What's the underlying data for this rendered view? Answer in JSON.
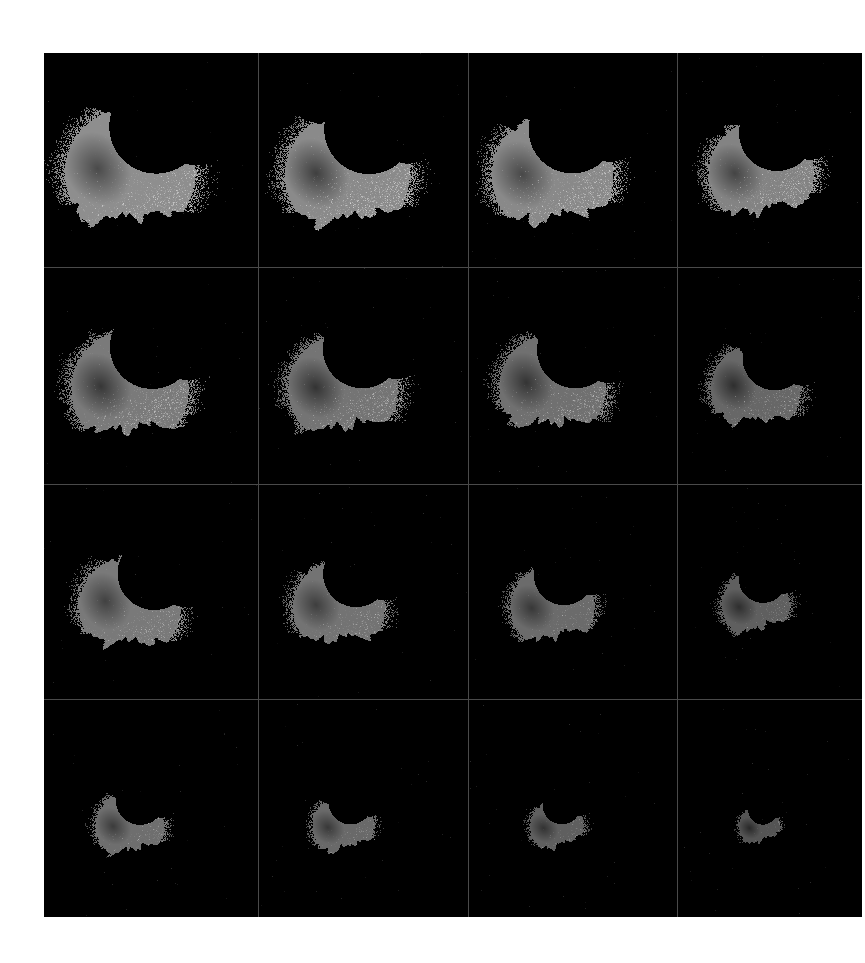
{
  "figure": {
    "name": "grayscale-particle-montage",
    "background_color": "#ffffff",
    "panel_background": "#000000",
    "grid_line_color": "#4a4a4a",
    "rows": 4,
    "columns": 4,
    "panel_count": 16,
    "left_margin_px": 44,
    "top_margin_px": 53,
    "grid_width_px": 818,
    "grid_height_px": 864
  },
  "palette": {
    "black": "#000000",
    "dark_core": "#3c3c3c",
    "mid_core": "#5a5a5a",
    "body_gray": "#8e8e8e",
    "light_gray": "#b8b8b8",
    "speckle_white": "#f2f2f2",
    "white": "#ffffff"
  },
  "chart_data": {
    "type": "heatmap",
    "title": "",
    "xlabel": "",
    "ylabel": "",
    "grid": true,
    "legend": "none",
    "panels": [
      {
        "index": 1,
        "row": 1,
        "col": 1,
        "label": "",
        "scale": 1.0,
        "brightness": 1.0,
        "cx": 0.4,
        "cy": 0.56,
        "rotation": -32,
        "core_gray": "#4a4a4a",
        "body_gray": "#8e8e8e",
        "speckle_density": 0.55,
        "area_fraction": 0.21
      },
      {
        "index": 2,
        "row": 1,
        "col": 2,
        "label": "",
        "scale": 0.98,
        "brightness": 1.0,
        "cx": 0.42,
        "cy": 0.57,
        "rotation": -36,
        "core_gray": "#3f3f3f",
        "body_gray": "#8a8a8a",
        "speckle_density": 0.6,
        "area_fraction": 0.2
      },
      {
        "index": 3,
        "row": 1,
        "col": 3,
        "label": "",
        "scale": 0.96,
        "brightness": 0.98,
        "cx": 0.4,
        "cy": 0.57,
        "rotation": -38,
        "core_gray": "#4a4a4a",
        "body_gray": "#8c8c8c",
        "speckle_density": 0.58,
        "area_fraction": 0.2
      },
      {
        "index": 4,
        "row": 1,
        "col": 4,
        "label": "",
        "scale": 0.94,
        "brightness": 0.96,
        "cx": 0.45,
        "cy": 0.56,
        "rotation": -40,
        "core_gray": "#474747",
        "body_gray": "#888888",
        "speckle_density": 0.6,
        "area_fraction": 0.19
      },
      {
        "index": 5,
        "row": 2,
        "col": 1,
        "label": "",
        "scale": 0.9,
        "brightness": 0.94,
        "cx": 0.4,
        "cy": 0.56,
        "rotation": -34,
        "core_gray": "#3a3a3a",
        "body_gray": "#828282",
        "speckle_density": 0.58,
        "area_fraction": 0.18
      },
      {
        "index": 6,
        "row": 2,
        "col": 2,
        "label": "",
        "scale": 0.86,
        "brightness": 0.92,
        "cx": 0.4,
        "cy": 0.56,
        "rotation": -36,
        "core_gray": "#383838",
        "body_gray": "#7e7e7e",
        "speckle_density": 0.56,
        "area_fraction": 0.17
      },
      {
        "index": 7,
        "row": 2,
        "col": 3,
        "label": "",
        "scale": 0.84,
        "brightness": 0.9,
        "cx": 0.4,
        "cy": 0.55,
        "rotation": -30,
        "core_gray": "#3a3a3a",
        "body_gray": "#7c7c7c",
        "speckle_density": 0.56,
        "area_fraction": 0.16
      },
      {
        "index": 8,
        "row": 2,
        "col": 4,
        "label": "",
        "scale": 0.8,
        "brightness": 0.86,
        "cx": 0.42,
        "cy": 0.56,
        "rotation": -30,
        "core_gray": "#363636",
        "body_gray": "#787878",
        "speckle_density": 0.52,
        "area_fraction": 0.15
      },
      {
        "index": 9,
        "row": 3,
        "col": 1,
        "label": "",
        "scale": 0.78,
        "brightness": 0.88,
        "cx": 0.4,
        "cy": 0.57,
        "rotation": -26,
        "core_gray": "#4a4a4a",
        "body_gray": "#8a8a8a",
        "speckle_density": 0.52,
        "area_fraction": 0.15
      },
      {
        "index": 10,
        "row": 3,
        "col": 2,
        "label": "",
        "scale": 0.72,
        "brightness": 0.86,
        "cx": 0.38,
        "cy": 0.57,
        "rotation": -34,
        "core_gray": "#484848",
        "body_gray": "#868686",
        "speckle_density": 0.5,
        "area_fraction": 0.13
      },
      {
        "index": 11,
        "row": 3,
        "col": 3,
        "label": "",
        "scale": 0.66,
        "brightness": 0.82,
        "cx": 0.4,
        "cy": 0.57,
        "rotation": -42,
        "core_gray": "#444444",
        "body_gray": "#828282",
        "speckle_density": 0.46,
        "area_fraction": 0.12
      },
      {
        "index": 12,
        "row": 3,
        "col": 4,
        "label": "",
        "scale": 0.6,
        "brightness": 0.78,
        "cx": 0.42,
        "cy": 0.56,
        "rotation": -46,
        "core_gray": "#3c3c3c",
        "body_gray": "#7a7a7a",
        "speckle_density": 0.44,
        "area_fraction": 0.1
      },
      {
        "index": 13,
        "row": 4,
        "col": 1,
        "label": "",
        "scale": 0.52,
        "brightness": 0.8,
        "cx": 0.4,
        "cy": 0.58,
        "rotation": -40,
        "core_gray": "#4a4a4a",
        "body_gray": "#8a8a8a",
        "speckle_density": 0.48,
        "area_fraction": 0.08
      },
      {
        "index": 14,
        "row": 4,
        "col": 2,
        "label": "",
        "scale": 0.48,
        "brightness": 0.78,
        "cx": 0.4,
        "cy": 0.58,
        "rotation": -44,
        "core_gray": "#484848",
        "body_gray": "#868686",
        "speckle_density": 0.46,
        "area_fraction": 0.07
      },
      {
        "index": 15,
        "row": 4,
        "col": 3,
        "label": "",
        "scale": 0.42,
        "brightness": 0.74,
        "cx": 0.42,
        "cy": 0.58,
        "rotation": -48,
        "core_gray": "#444444",
        "body_gray": "#808080",
        "speckle_density": 0.44,
        "area_fraction": 0.05
      },
      {
        "index": 16,
        "row": 4,
        "col": 4,
        "label": "",
        "scale": 0.36,
        "brightness": 0.7,
        "cx": 0.44,
        "cy": 0.58,
        "rotation": -50,
        "core_gray": "#3a3a3a",
        "body_gray": "#787878",
        "speckle_density": 0.42,
        "area_fraction": 0.04
      }
    ]
  }
}
